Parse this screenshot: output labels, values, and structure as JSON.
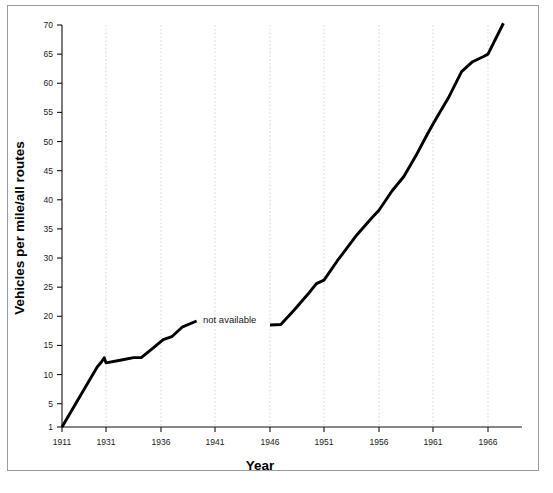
{
  "figure": {
    "background_color": "#ffffff",
    "frame_color": "#9a9a9a",
    "line_color": "#000000",
    "grid_color": "#c2c2c2"
  },
  "annotations": {
    "not_available": "not available"
  },
  "chart_data": {
    "type": "line",
    "title": "",
    "xlabel": "Year",
    "ylabel": "Vehicles per mile/all routes",
    "xtick_labels": [
      "1911",
      "1931",
      "1936",
      "1941",
      "1946",
      "1951",
      "1956",
      "1961",
      "1966"
    ],
    "xtick_values": [
      1911,
      1931,
      1936,
      1941,
      1946,
      1951,
      1956,
      1961,
      1966
    ],
    "ytick_labels": [
      "1",
      "5",
      "10",
      "15",
      "20",
      "25",
      "30",
      "35",
      "40",
      "45",
      "50",
      "55",
      "60",
      "65",
      "70"
    ],
    "ytick_values": [
      1,
      5,
      10,
      15,
      20,
      25,
      30,
      35,
      40,
      45,
      50,
      55,
      60,
      65,
      70
    ],
    "ylim": [
      1,
      70
    ],
    "xlim": [
      1911,
      1967.6
    ],
    "grid": "vertical-dotted",
    "legend": "none",
    "gap_label": "not available",
    "series": [
      {
        "name": "Vehicles per mile/all routes (1911-1939)",
        "points": [
          {
            "x": 1911,
            "y": 1.0
          },
          {
            "x": 1927.0,
            "y": 11.3
          },
          {
            "x": 1929.0,
            "y": 12.2
          },
          {
            "x": 1930.2,
            "y": 12.9
          },
          {
            "x": 1931.0,
            "y": 12.0
          },
          {
            "x": 1932.4,
            "y": 12.5
          },
          {
            "x": 1933.5,
            "y": 12.9
          },
          {
            "x": 1934.2,
            "y": 12.9
          },
          {
            "x": 1935.3,
            "y": 14.6
          },
          {
            "x": 1936.2,
            "y": 16.0
          },
          {
            "x": 1937.0,
            "y": 16.5
          },
          {
            "x": 1938.0,
            "y": 18.2
          },
          {
            "x": 1939.3,
            "y": 19.2
          }
        ]
      },
      {
        "name": "Vehicles per mile/all routes (1946-1967)",
        "points": [
          {
            "x": 1946.0,
            "y": 18.5
          },
          {
            "x": 1947.0,
            "y": 18.6
          },
          {
            "x": 1948.2,
            "y": 21.0
          },
          {
            "x": 1949.6,
            "y": 24.0
          },
          {
            "x": 1950.3,
            "y": 25.6
          },
          {
            "x": 1951.0,
            "y": 26.2
          },
          {
            "x": 1952.2,
            "y": 29.5
          },
          {
            "x": 1954.0,
            "y": 34.0
          },
          {
            "x": 1955.4,
            "y": 37.0
          },
          {
            "x": 1956.0,
            "y": 38.2
          },
          {
            "x": 1957.2,
            "y": 41.5
          },
          {
            "x": 1958.3,
            "y": 44.0
          },
          {
            "x": 1959.4,
            "y": 47.5
          },
          {
            "x": 1960.4,
            "y": 51.0
          },
          {
            "x": 1961.0,
            "y": 53.0
          },
          {
            "x": 1962.4,
            "y": 57.5
          },
          {
            "x": 1963.6,
            "y": 62.0
          },
          {
            "x": 1964.6,
            "y": 63.7
          },
          {
            "x": 1965.6,
            "y": 64.6
          },
          {
            "x": 1966.0,
            "y": 65.0
          },
          {
            "x": 1967.4,
            "y": 70.3
          }
        ]
      }
    ]
  }
}
